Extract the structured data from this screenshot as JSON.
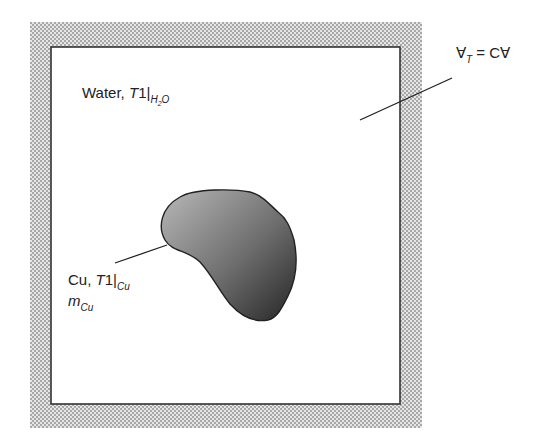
{
  "diagram": {
    "type": "control-volume-schematic",
    "container": {
      "outer_wall": "insulated (stippled)",
      "inner_region": "Water"
    },
    "labels": {
      "water": {
        "prefix": "Water, ",
        "symbol": "T",
        "index": "1",
        "bar": "|",
        "subscript": "H",
        "subscript_num": "2",
        "subscript_tail": "O"
      },
      "volume": {
        "symbol": "∀",
        "subscript": "T",
        "equals": " = C∀"
      },
      "copper": {
        "prefix": "Cu, ",
        "symbol": "T",
        "index": "1",
        "bar": "|",
        "subscript": "Cu",
        "mass_symbol": "m",
        "mass_subscript": "Cu"
      }
    },
    "colors": {
      "stipple": "#9a9a9a",
      "border": "#333333",
      "blob_light": "#b0b0b0",
      "blob_dark": "#2e2e2e"
    }
  }
}
